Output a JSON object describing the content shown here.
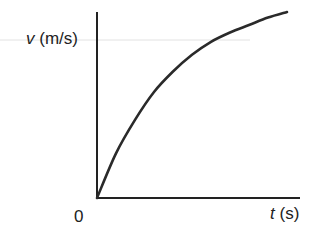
{
  "chart_data": {
    "type": "line",
    "title": "",
    "xlabel": "t (s)",
    "ylabel": "v (m/s)",
    "xlabel_var": "t",
    "xlabel_unit": "(s)",
    "ylabel_var": "v",
    "ylabel_unit": "(m/s)",
    "origin_label": "0",
    "grid": false,
    "legend": null,
    "series": [
      {
        "name": "v(t)",
        "x": [
          0,
          0.1,
          0.2,
          0.3,
          0.4,
          0.5,
          0.6,
          0.7,
          0.8,
          0.9,
          1.0
        ],
        "values": [
          0,
          0.24,
          0.42,
          0.57,
          0.68,
          0.77,
          0.84,
          0.89,
          0.93,
          0.97,
          1.0
        ]
      }
    ],
    "xlim": [
      0,
      1.07
    ],
    "ylim": [
      0,
      1.0
    ],
    "colors": {
      "axis": "#222222",
      "curve": "#2a2a2a",
      "artifact_line": "#dcdcdc"
    }
  }
}
